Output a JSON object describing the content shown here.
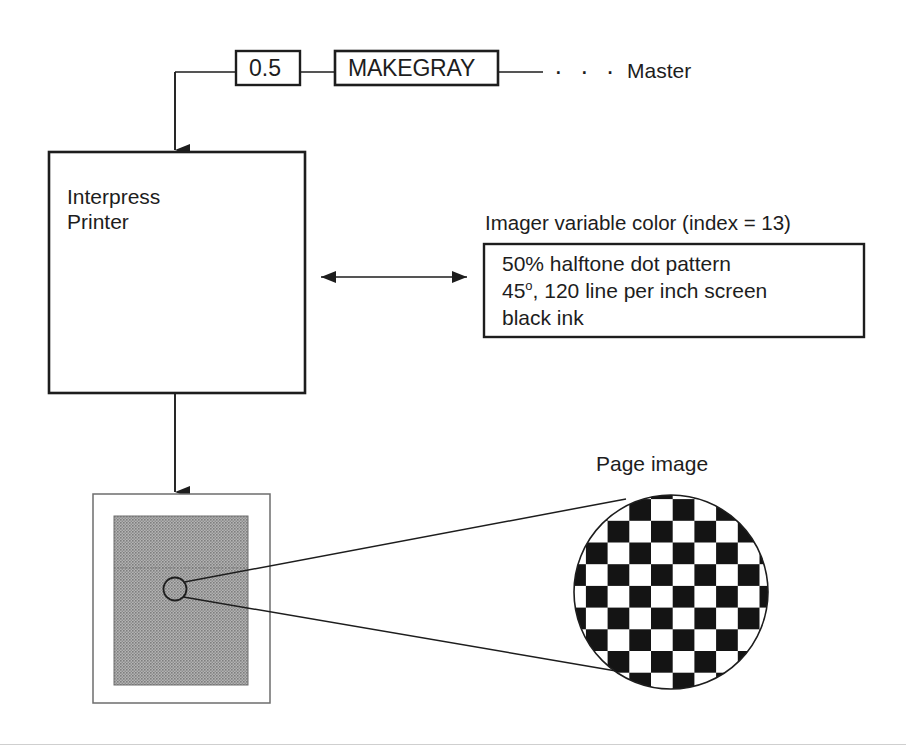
{
  "diagram": {
    "background_color": "#ffffff",
    "line_color": "#1d1d1d",
    "gray_fill_color": "#9a9a9a",
    "ink_color": "#111111"
  },
  "master_row": {
    "value_box": {
      "label": "0.5"
    },
    "operator_box": {
      "label": "MAKEGRAY"
    },
    "ellipsis": "· · ·",
    "master_label": "Master"
  },
  "printer": {
    "line1": "Interpress",
    "line2": "Printer"
  },
  "imager_color": {
    "caption": "Imager variable color (index = 13)",
    "index": 13,
    "lines": [
      "50% halftone dot pattern",
      "45°, 120 line per inch screen",
      "black ink"
    ],
    "line2_prefix": "45",
    "line2_degree": "o",
    "line2_suffix": ", 120 line per inch screen"
  },
  "page_output": {
    "page_image_label": "Page image",
    "gray_level": "50%"
  },
  "magnifier": {
    "pattern": "checkerboard",
    "cells_across": 9,
    "description": "50% halftone dot pattern magnified"
  }
}
